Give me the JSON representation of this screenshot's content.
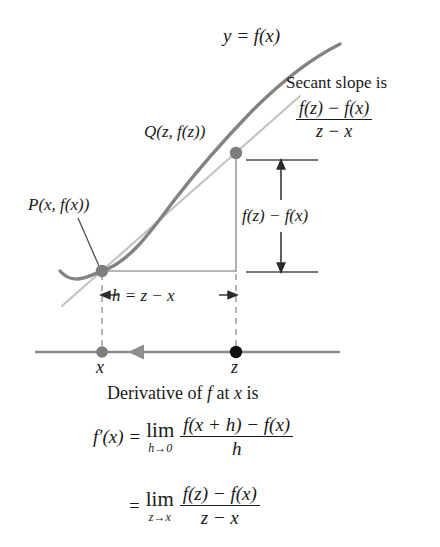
{
  "figure": {
    "name": "derivative-secant-slope-diagram",
    "colors": {
      "curve": "#838383",
      "secant": "#bdbdbd",
      "axis": "#8a8a8a",
      "dashed": "#9a9a9a",
      "point_p": "#7d7d7d",
      "point_z": "#111111",
      "point_x": "#7d7d7d",
      "arrow": "#9a9a9a",
      "text": "#1a1a1a",
      "rule": "#555555"
    },
    "curve_label": "y = f(x)",
    "secant": {
      "caption": "Secant slope is",
      "numerator": "f(z) − f(x)",
      "denominator": "z − x"
    },
    "points": {
      "q_label": "Q(z, f(z))",
      "p_label": "P(x, f(x))"
    },
    "measurements": {
      "rise_label": "f(z) − f(x)",
      "run_label": "h = z − x",
      "run_arrow_left": "←",
      "run_arrow_right": "→"
    },
    "axis": {
      "tick_x_label": "x",
      "tick_z_label": "z"
    }
  },
  "caption": {
    "heading_pre": "Derivative of",
    "heading_f": "f",
    "heading_mid": "at",
    "heading_x": "x",
    "heading_post": "is"
  },
  "formulas": {
    "first": {
      "lhs": "f′(x)",
      "equals": "=",
      "lim": "lim",
      "lim_sub": "h→0",
      "numerator": "f(x + h) − f(x)",
      "denominator": "h"
    },
    "second": {
      "equals": "=",
      "lim": "lim",
      "lim_sub": "z→x",
      "numerator": "f(z) − f(x)",
      "denominator": "z − x"
    }
  }
}
